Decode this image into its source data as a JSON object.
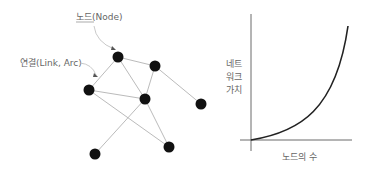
{
  "network": {
    "node_label": "노드(Node)",
    "link_label": "연결(Link, Arc)",
    "node_color": "#111111",
    "edge_color": "#bbbbbb",
    "nodes": [
      {
        "id": "A",
        "x": 118,
        "y": 57
      },
      {
        "id": "B",
        "x": 155,
        "y": 66
      },
      {
        "id": "C",
        "x": 89,
        "y": 90
      },
      {
        "id": "D",
        "x": 145,
        "y": 99
      },
      {
        "id": "E",
        "x": 201,
        "y": 104
      },
      {
        "id": "F",
        "x": 169,
        "y": 147
      },
      {
        "id": "G",
        "x": 95,
        "y": 154
      }
    ],
    "edges": [
      [
        "A",
        "B"
      ],
      [
        "A",
        "C"
      ],
      [
        "A",
        "D"
      ],
      [
        "B",
        "D"
      ],
      [
        "B",
        "E"
      ],
      [
        "C",
        "D"
      ],
      [
        "C",
        "F"
      ],
      [
        "D",
        "F"
      ],
      [
        "D",
        "G"
      ]
    ]
  },
  "graph": {
    "ylabel_lines": [
      "네트",
      "워크",
      "가치"
    ],
    "xlabel": "노드의 수",
    "curve_type": "exponential growth"
  }
}
